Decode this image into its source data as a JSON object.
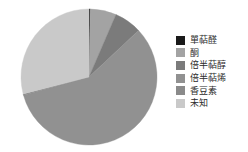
{
  "chart_data": {
    "type": "pie",
    "title": "",
    "legend_position": "right",
    "categories": [
      "單萜醛",
      "酮",
      "倍半萜醇",
      "倍半萜烯",
      "香豆素",
      "未知"
    ],
    "values": [
      0.3,
      6.2,
      6.5,
      57.7,
      0.3,
      29.0
    ],
    "units": "%",
    "colors": [
      "#1a1a1a",
      "#a3a3a3",
      "#7b7b7b",
      "#919191",
      "#8a8a8a",
      "#c9c9c9"
    ],
    "slices": [
      {
        "label": "單萜醛",
        "value": 0.3,
        "color": "#1a1a1a",
        "start_angle": 0.0,
        "end_angle": 1.1
      },
      {
        "label": "酮",
        "value": 6.2,
        "color": "#a3a3a3",
        "start_angle": 1.1,
        "end_angle": 23.4
      },
      {
        "label": "倍半萜醇",
        "value": 6.5,
        "color": "#7b7b7b",
        "start_angle": 23.4,
        "end_angle": 46.8
      },
      {
        "label": "倍半萜烯",
        "value": 57.7,
        "color": "#919191",
        "start_angle": 46.8,
        "end_angle": 254.5
      },
      {
        "label": "香豆素",
        "value": 0.3,
        "color": "#8a8a8a",
        "start_angle": 254.5,
        "end_angle": 255.6
      },
      {
        "label": "未知",
        "value": 29.0,
        "color": "#c9c9c9",
        "start_angle": 255.6,
        "end_angle": 360.0
      }
    ],
    "geometry": {
      "center_x": 70,
      "center_y": 70,
      "radius": 68
    }
  },
  "legend": {
    "items": [
      {
        "label": "單萜醛",
        "color": "#1a1a1a"
      },
      {
        "label": "酮",
        "color": "#a3a3a3"
      },
      {
        "label": "倍半萜醇",
        "color": "#7b7b7b"
      },
      {
        "label": "倍半萜烯",
        "color": "#919191"
      },
      {
        "label": "香豆素",
        "color": "#8a8a8a"
      },
      {
        "label": "未知",
        "color": "#c9c9c9"
      }
    ]
  }
}
